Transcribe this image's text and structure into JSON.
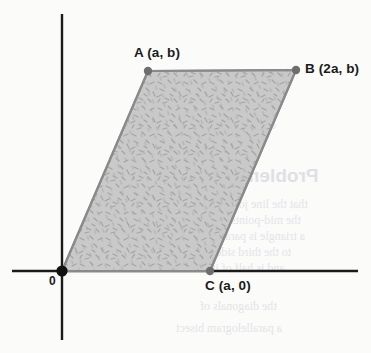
{
  "figure": {
    "background_color": "#fbfbfa",
    "axis_color": "#1b1b1b",
    "shape_fill_color": "#c9c9c9",
    "shape_stroke_color": "#8a8a8a",
    "vertex_marker_color": "#6e6e6e",
    "origin_marker_color": "#111111",
    "label_color": "#1b1b1b"
  },
  "axes": {
    "x_axis": {
      "name": "x-axis",
      "y": 271,
      "x_start": 12,
      "x_end": 358
    },
    "y_axis": {
      "name": "y-axis",
      "x": 62,
      "y_start": 14,
      "y_end": 340
    },
    "origin": {
      "label": "0",
      "x": 62,
      "y": 271
    }
  },
  "shape": {
    "type": "parallelogram",
    "fill_pattern": "speckled-dash-texture",
    "vertices": [
      {
        "id": "O",
        "label": "0",
        "x": 62,
        "y": 271,
        "marker": "origin",
        "marker_radius": 5.6
      },
      {
        "id": "C",
        "label": "C (a, 0)",
        "x": 210,
        "y": 271,
        "marker": "vertex",
        "marker_radius": 4.2
      },
      {
        "id": "B",
        "label": "B (2a, b)",
        "x": 296,
        "y": 70,
        "marker": "vertex",
        "marker_radius": 4.2
      },
      {
        "id": "A",
        "label": "A (a, b)",
        "x": 148,
        "y": 71,
        "marker": "vertex",
        "marker_radius": 4.2
      }
    ]
  },
  "labels": {
    "a": {
      "text": "A (a, b)",
      "x": 134,
      "y": 46
    },
    "b": {
      "text": "B (2a, b)",
      "x": 305,
      "y": 62
    },
    "c": {
      "text": "C (a, 0)",
      "x": 205,
      "y": 279
    },
    "o": {
      "text": "0",
      "x": 49,
      "y": 275
    }
  },
  "ghost_text": {
    "note": "faint bleed-through from reverse of scanned page",
    "lines": [
      {
        "text": "rhombus",
        "x": 222,
        "y": 88,
        "size": 11,
        "weight": "400"
      },
      {
        "text": "of vectors",
        "x": 232,
        "y": 120,
        "size": 11,
        "weight": "400"
      },
      {
        "text": "Problems",
        "x": 232,
        "y": 166,
        "size": 19,
        "weight": "700"
      },
      {
        "text": "that the line joining",
        "x": 214,
        "y": 198,
        "size": 12,
        "weight": "400"
      },
      {
        "text": "the mid-points of",
        "x": 218,
        "y": 214,
        "size": 12,
        "weight": "400"
      },
      {
        "text": "a triangle is parallel",
        "x": 210,
        "y": 230,
        "size": 12,
        "weight": "400"
      },
      {
        "text": "to the third side",
        "x": 216,
        "y": 246,
        "size": 12,
        "weight": "400"
      },
      {
        "text": "and is half of it",
        "x": 212,
        "y": 262,
        "size": 12,
        "weight": "400"
      },
      {
        "text": "the diagonals of",
        "x": 200,
        "y": 300,
        "size": 12,
        "weight": "400"
      },
      {
        "text": "a parallelogram bisect",
        "x": 176,
        "y": 322,
        "size": 12,
        "weight": "400"
      }
    ]
  }
}
